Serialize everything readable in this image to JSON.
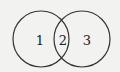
{
  "diagram": {
    "type": "venn",
    "sets": [
      {
        "name": "left-circle",
        "region_label": "1"
      },
      {
        "name": "right-circle",
        "region_label": "3"
      }
    ],
    "intersection_label": "2",
    "stroke_color": "#333333",
    "background": "#f2f2f0"
  }
}
